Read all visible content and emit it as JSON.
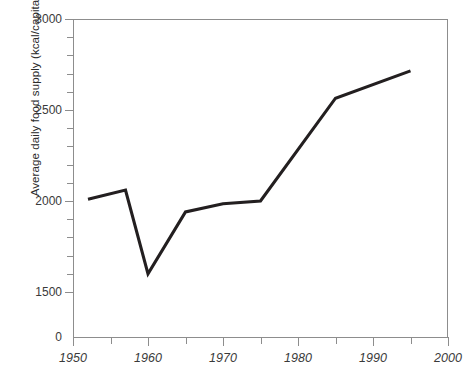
{
  "chart_data": {
    "type": "line",
    "title": "",
    "subtitle": "",
    "xlabel": "",
    "ylabel": "Average daily food supply (kcal/capita)",
    "grid": false,
    "legend": null,
    "legend_position": "none",
    "line_color": "#231f20",
    "axis_color": "#8d8d8d",
    "xlim": [
      1950,
      2000
    ],
    "ylim": [
      1450,
      3000
    ],
    "y_axis_break": true,
    "y_zero_label": "0",
    "x": [
      1952,
      1957,
      1960,
      1965,
      1970,
      1975,
      1985,
      1995
    ],
    "values": [
      2010,
      2060,
      1600,
      1940,
      1985,
      2000,
      2565,
      2715
    ],
    "series": [
      {
        "name": "Average daily food supply",
        "x": [
          1952,
          1957,
          1960,
          1965,
          1970,
          1975,
          1985,
          1995
        ],
        "values": [
          2010,
          2060,
          1600,
          1940,
          1985,
          2000,
          2565,
          2715
        ]
      }
    ],
    "y_major_ticks": [
      1500,
      2000,
      2500,
      3000
    ],
    "y_major_labels": [
      "1500",
      "2000",
      "2500",
      "3000"
    ],
    "y_minor_ticks": [
      1600,
      1700,
      1800,
      1900,
      2100,
      2200,
      2300,
      2400,
      2600,
      2700,
      2800,
      2900
    ],
    "x_major_ticks": [
      1950,
      1960,
      1970,
      1980,
      1990,
      2000
    ],
    "x_major_labels": [
      "1950",
      "1960",
      "1970",
      "1980",
      "1990",
      "2000"
    ],
    "x_minor_ticks": [
      1955,
      1965,
      1975,
      1985,
      1995
    ],
    "footnote": ""
  }
}
